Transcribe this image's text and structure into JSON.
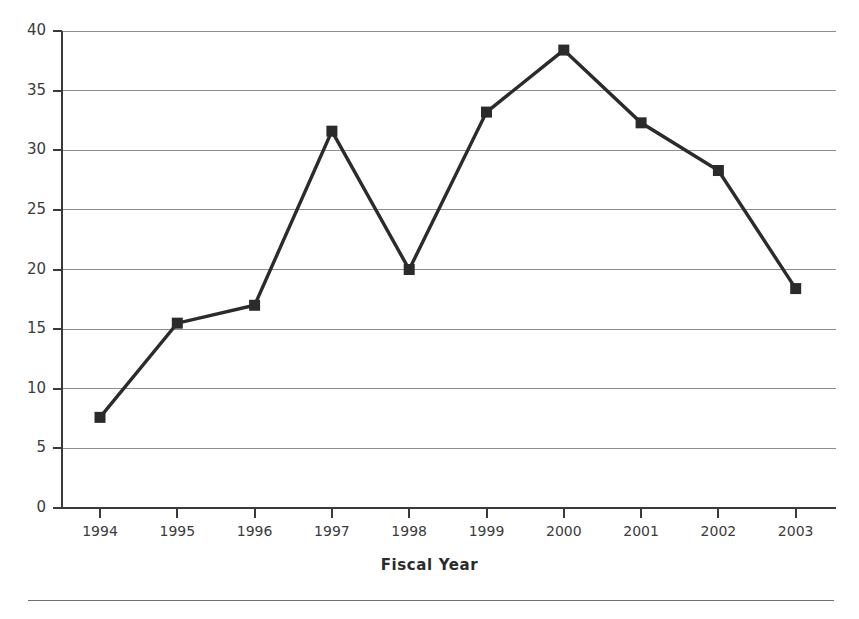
{
  "chart_data": {
    "type": "line",
    "title": "",
    "subtitle": "",
    "xlabel": "Fiscal Year",
    "ylabel": "",
    "categories": [
      "1994",
      "1995",
      "1996",
      "1997",
      "1998",
      "1999",
      "2000",
      "2001",
      "2002",
      "2003"
    ],
    "values": [
      7.6,
      15.5,
      17.0,
      31.6,
      20.0,
      33.2,
      38.4,
      32.3,
      28.3,
      18.4
    ],
    "series": [
      {
        "name": "",
        "values": [
          7.6,
          15.5,
          17.0,
          31.6,
          20.0,
          33.2,
          38.4,
          32.3,
          28.3,
          18.4
        ]
      }
    ],
    "ylim": [
      0,
      40
    ],
    "ytick_labels": [
      "0",
      "5",
      "10",
      "15",
      "20",
      "25",
      "30",
      "35",
      "40"
    ],
    "ytick_values": [
      0,
      5,
      10,
      15,
      20,
      25,
      30,
      35,
      40
    ],
    "grid": "horizontal",
    "legend": "none",
    "marker": "square",
    "line_color": "#2b2b2b",
    "marker_color": "#2b2b2b",
    "grid_color": "#8d8d8d",
    "axis_color": "#3a3a3a",
    "background_color": "#ffffff"
  },
  "figure": {
    "x_axis_title": "Fiscal Year"
  }
}
